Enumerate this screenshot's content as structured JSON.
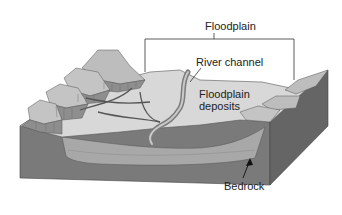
{
  "diagram": {
    "labels": {
      "floodplain": "Floodplain",
      "river_channel": "River channel",
      "floodplain_deposits": "Floodplain deposits",
      "bedrock": "Bedrock"
    },
    "colors": {
      "background": "#ffffff",
      "bedrock": "#7a7a7a",
      "bedrock_side": "#6a6a6a",
      "deposits": "#a6a6a6",
      "floodplain_surface": "#d6d6d6",
      "terrace": "#bdbdbd",
      "terrace_cliff": "#8e8e8e",
      "channel": "#9a9a9a",
      "line": "#333333"
    }
  }
}
